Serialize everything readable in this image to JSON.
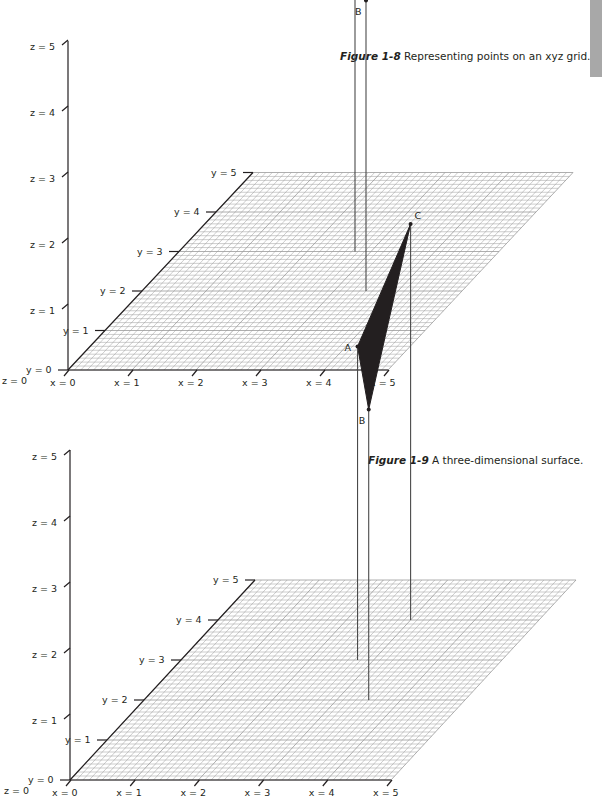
{
  "side_tab": {
    "color": "#a8a8a8"
  },
  "figures": [
    {
      "id": "fig-1-8",
      "caption": {
        "number": "Figure 1-8",
        "text": " Representing points on an xyz grid."
      },
      "origin": [
        68,
        370
      ],
      "x_unit": [
        64,
        0
      ],
      "y_unit": [
        37,
        -39.5
      ],
      "z_unit": 66,
      "z_axis_top": 41,
      "axis_labels": {
        "x": [
          "x = 0",
          "x = 1",
          "x = 2",
          "x = 3",
          "x = 4",
          "x = 5"
        ],
        "y": [
          "y = 0",
          "y = 1",
          "y = 2",
          "y = 3",
          "y = 4",
          "y = 5"
        ],
        "z": [
          "z = 0",
          "z = 1",
          "z = 2",
          "z = 3",
          "z = 4",
          "z = 5"
        ]
      },
      "points": [
        {
          "label": "A",
          "x": 2.75,
          "y": 3.0,
          "z": 4.75
        },
        {
          "label": "B",
          "x": 3.5,
          "y": 2.0,
          "z": 4.4
        }
      ],
      "surface": false
    },
    {
      "id": "fig-1-9",
      "caption": {
        "number": "Figure 1-9",
        "text": " A three-dimensional surface."
      },
      "origin": [
        70,
        780
      ],
      "x_unit": [
        64.2,
        0
      ],
      "y_unit": [
        37,
        -40
      ],
      "z_unit": 66,
      "z_axis_top": 450,
      "axis_labels": {
        "x": [
          "x = 0",
          "x = 1",
          "x = 2",
          "x = 3",
          "x = 4",
          "x = 5"
        ],
        "y": [
          "y = 0",
          "y = 1",
          "y = 2",
          "y = 3",
          "y = 4",
          "y = 5"
        ],
        "z": [
          "z = 0",
          "z = 1",
          "z = 2",
          "z = 3",
          "z = 4",
          "z = 5"
        ]
      },
      "points": [
        {
          "label": "A",
          "x": 2.75,
          "y": 3.0,
          "z": 4.75
        },
        {
          "label": "B",
          "x": 3.5,
          "y": 2.0,
          "z": 4.4
        },
        {
          "label": "C",
          "x": 3.0,
          "y": 4.0,
          "z": 6.0
        }
      ],
      "surface": true,
      "surface_color": "#231f20"
    }
  ],
  "chart_data": [
    {
      "type": "scatter",
      "title": "Figure 1-8 Representing points on an xyz grid.",
      "xlabel": "x",
      "ylabel": "y",
      "zlabel": "z",
      "xlim": [
        0,
        5
      ],
      "ylim": [
        0,
        5
      ],
      "zlim": [
        0,
        5
      ],
      "grid": true,
      "points": [
        {
          "label": "A",
          "x": 2.75,
          "y": 3.0,
          "z": 4.75
        },
        {
          "label": "B",
          "x": 3.5,
          "y": 2.0,
          "z": 4.4
        }
      ]
    },
    {
      "type": "scatter",
      "title": "Figure 1-9 A three-dimensional surface.",
      "xlabel": "x",
      "ylabel": "y",
      "zlabel": "z",
      "xlim": [
        0,
        5
      ],
      "ylim": [
        0,
        5
      ],
      "zlim": [
        0,
        5
      ],
      "grid": true,
      "surface": "triangle ABC (filled)",
      "points": [
        {
          "label": "A",
          "x": 2.75,
          "y": 3.0,
          "z": 4.75
        },
        {
          "label": "B",
          "x": 3.5,
          "y": 2.0,
          "z": 4.4
        },
        {
          "label": "C",
          "x": 3.0,
          "y": 4.0,
          "z": 6.0
        }
      ]
    }
  ]
}
